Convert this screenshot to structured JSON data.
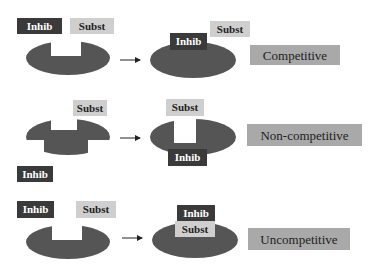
{
  "colors": {
    "enzyme": "#555555",
    "inhib_box": "#3a3a3a",
    "inhib_text": "#ffffff",
    "subst_box": "#cfcfcf",
    "subst_text": "#222222",
    "label_box": "#a9a9a9",
    "arrow": "#222222"
  },
  "rows": [
    {
      "type_label": "Competitive",
      "left": {
        "inhib": "Inhib",
        "subst": "Subst"
      },
      "right": {
        "inhib": "Inhib",
        "subst": "Subst"
      }
    },
    {
      "type_label": "Non-competitive",
      "left": {
        "inhib": "Inhib",
        "subst": "Subst"
      },
      "right": {
        "inhib": "Inhib",
        "subst": "Subst"
      }
    },
    {
      "type_label": "Uncompetitive",
      "left": {
        "inhib": "Inhib",
        "subst": "Subst"
      },
      "right": {
        "inhib": "Inhib",
        "subst": "Subst"
      }
    }
  ]
}
